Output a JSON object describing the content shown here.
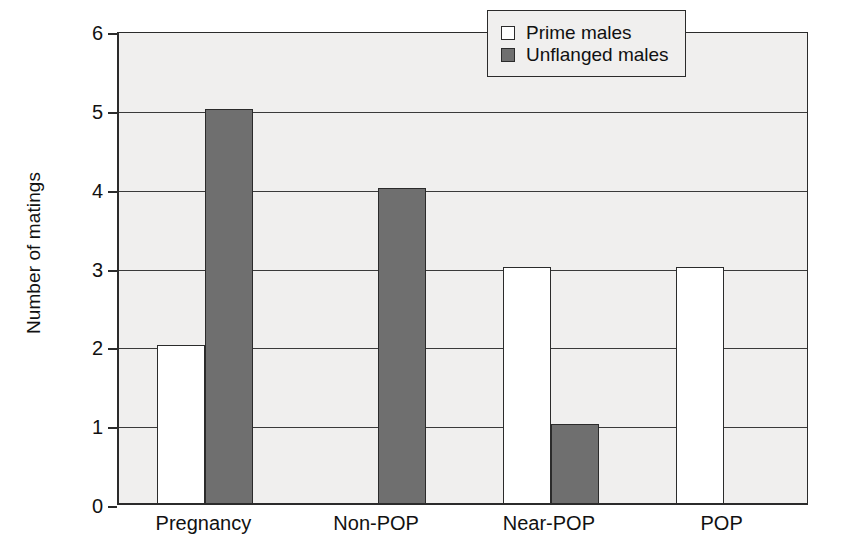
{
  "chart_data": {
    "type": "bar",
    "title": "",
    "xlabel": "",
    "ylabel": "Number of matings",
    "categories": [
      "Pregnancy",
      "Non-POP",
      "Near-POP",
      "POP"
    ],
    "series": [
      {
        "name": "Prime males",
        "values": [
          2,
          0,
          3,
          3
        ],
        "color": "#ffffff",
        "swatch": "open-square"
      },
      {
        "name": "Unflanged males",
        "values": [
          5,
          4,
          1,
          0
        ],
        "color": "#6f6f6f",
        "swatch": "filled-square"
      }
    ],
    "ylim": [
      0,
      6
    ],
    "yticks": [
      0,
      1,
      2,
      3,
      4,
      5,
      6
    ],
    "ytick_labels": [
      "0",
      "1",
      "2",
      "3",
      "4",
      "5",
      "6"
    ],
    "grid": true,
    "grid_axis": "y",
    "legend_position": "top-right-inside",
    "plot_background": "#f0efee",
    "axis_color": "#2b2b2b"
  },
  "legend": {
    "entries": [
      {
        "label": "Prime males"
      },
      {
        "label": "Unflanged males"
      }
    ]
  }
}
